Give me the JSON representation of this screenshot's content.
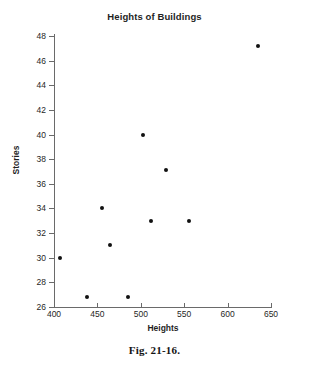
{
  "chart_data": {
    "type": "scatter",
    "title": "Heights of Buildings",
    "xlabel": "Heights",
    "ylabel": "Stories",
    "xlim": [
      400,
      650
    ],
    "ylim": [
      26,
      48
    ],
    "xticks": [
      400,
      450,
      500,
      550,
      600,
      650
    ],
    "yticks": [
      26,
      28,
      30,
      32,
      34,
      36,
      38,
      40,
      42,
      44,
      46,
      48
    ],
    "grid": false,
    "legend": null,
    "series": [
      {
        "name": "Buildings",
        "marker": "filled-circle",
        "color": "#111111",
        "points": [
          {
            "x": 407,
            "y": 30.0
          },
          {
            "x": 438,
            "y": 26.8
          },
          {
            "x": 455,
            "y": 34.0
          },
          {
            "x": 465,
            "y": 31.0
          },
          {
            "x": 485,
            "y": 26.8
          },
          {
            "x": 503,
            "y": 40.0
          },
          {
            "x": 512,
            "y": 33.0
          },
          {
            "x": 529,
            "y": 37.1
          },
          {
            "x": 556,
            "y": 33.0
          },
          {
            "x": 635,
            "y": 47.2
          }
        ]
      }
    ]
  },
  "caption": "Fig. 21-16.",
  "colors": {
    "axis": "#6a6a6a",
    "marker": "#111111",
    "text": "#1f1f1f",
    "background": "#ffffff"
  }
}
